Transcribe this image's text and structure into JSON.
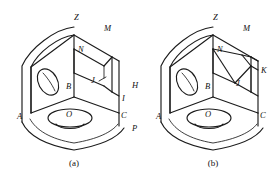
{
  "page": {
    "background_color": "#ffffff",
    "line_color": "#1b1b1b",
    "figure_count": 2
  },
  "figures": [
    {
      "id": "a",
      "caption": "(a)",
      "description": "Isometric view of an L-shaped corner bracket with a rectangular step cut on the upper right and two circular holes.",
      "labels": [
        {
          "key": "Z",
          "text": "Z",
          "x": 74,
          "y": 20
        },
        {
          "key": "M",
          "text": "M",
          "x": 104,
          "y": 31
        },
        {
          "key": "N",
          "text": "N",
          "x": 78,
          "y": 52
        },
        {
          "key": "B",
          "text": "B",
          "x": 69,
          "y": 89
        },
        {
          "key": "J",
          "text": "J",
          "x": 95,
          "y": 83
        },
        {
          "key": "H",
          "text": "H",
          "x": 136,
          "y": 88
        },
        {
          "key": "I",
          "text": "I",
          "x": 125,
          "y": 100
        },
        {
          "key": "A",
          "text": "A",
          "x": 17,
          "y": 119
        },
        {
          "key": "O",
          "text": "O",
          "x": 69,
          "y": 116
        },
        {
          "key": "C",
          "text": "C",
          "x": 124,
          "y": 118
        },
        {
          "key": "P",
          "text": "P",
          "x": 136,
          "y": 131
        }
      ]
    },
    {
      "id": "b",
      "caption": "(b)",
      "description": "Isometric view of the same corner bracket with the upper right corner replaced by an inclined chamfered face N-M-K-J.",
      "labels": [
        {
          "key": "Z",
          "text": "Z",
          "x": 74,
          "y": 20
        },
        {
          "key": "M",
          "text": "M",
          "x": 104,
          "y": 31
        },
        {
          "key": "N",
          "text": "N",
          "x": 78,
          "y": 52
        },
        {
          "key": "B",
          "text": "B",
          "x": 69,
          "y": 89
        },
        {
          "key": "J",
          "text": "J",
          "x": 101,
          "y": 85
        },
        {
          "key": "K",
          "text": "K",
          "x": 126,
          "y": 73
        },
        {
          "key": "A",
          "text": "A",
          "x": 17,
          "y": 119
        },
        {
          "key": "O",
          "text": "O",
          "x": 69,
          "y": 116
        },
        {
          "key": "C",
          "text": "C",
          "x": 124,
          "y": 118
        }
      ]
    }
  ],
  "geometry": {
    "top_vertex_Z": "apex of the upper back corner",
    "center_vertex_B": "interior corner where the three visible faces meet",
    "holes": [
      {
        "name": "left-face-hole",
        "shape": "ellipse",
        "on_face": "left vertical face"
      },
      {
        "name": "base-hole",
        "shape": "ellipse-with-depth",
        "on_face": "bottom horizontal face"
      }
    ]
  }
}
